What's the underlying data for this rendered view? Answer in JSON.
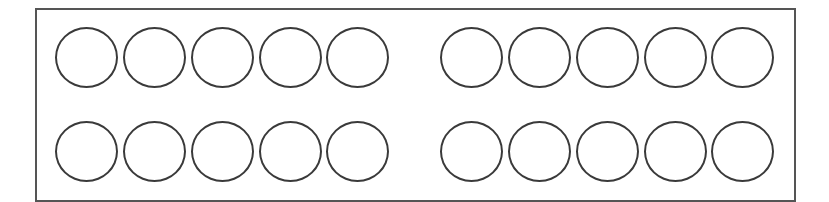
{
  "diagram": {
    "frame": {
      "border_color": "#555555"
    },
    "circle_style": {
      "stroke_color": "#3a3a3a",
      "fill": "none"
    },
    "groups": [
      {
        "name": "left-group",
        "rows": 2,
        "columns": 5,
        "centers_x": [
          87,
          155,
          223,
          291,
          358
        ]
      },
      {
        "name": "right-group",
        "rows": 2,
        "columns": 5,
        "centers_x": [
          472,
          540,
          608,
          676,
          743
        ]
      }
    ],
    "row_centers_y": [
      58,
      152
    ],
    "total_circles": 20
  }
}
